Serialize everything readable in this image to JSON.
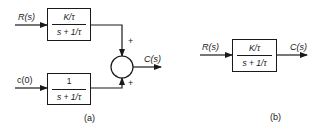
{
  "diagram_a": {
    "caption": "(a)",
    "input_top_label": "R(s)",
    "input_bottom_label": "c(0)",
    "output_label": "C(s)",
    "top_block": {
      "numerator": "K/τ",
      "denominator": "s + 1/τ"
    },
    "bottom_block": {
      "numerator": "1",
      "denominator": "s + 1/τ"
    },
    "summing_junction": {
      "top_sign": "+",
      "bottom_sign": "+"
    }
  },
  "diagram_b": {
    "caption": "(b)",
    "input_label": "R(s)",
    "output_label": "C(s)",
    "block": {
      "numerator": "K/τ",
      "denominator": "s + 1/τ"
    }
  },
  "colors": {
    "ink": "#1a1a1a",
    "background": "#ffffff"
  }
}
